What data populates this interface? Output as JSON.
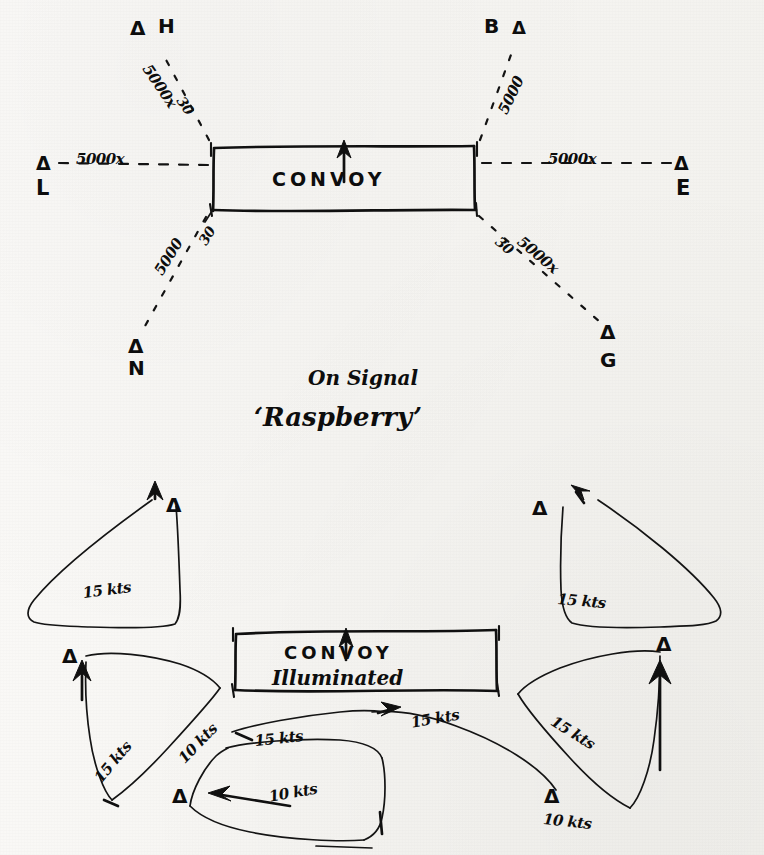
{
  "document": {
    "kind": "hand-drawn naval tactical diagram",
    "ink_color": "#0d0d0d",
    "paper_color": "#f7f6f3"
  },
  "upper_diagram": {
    "convoy_box_label": "CONVOY",
    "convoy_heading_arrow": "up-arrow",
    "escorts": [
      {
        "id": "H",
        "label": "H",
        "marker": "Δ",
        "position": "port-bow",
        "range": "5000x",
        "bearing": "30"
      },
      {
        "id": "B",
        "label": "B",
        "marker": "Δ",
        "position": "starboard-bow",
        "range": "5000",
        "bearing": ""
      },
      {
        "id": "L",
        "label": "L",
        "marker": "Δ",
        "position": "port-beam",
        "range": "5000x",
        "bearing": ""
      },
      {
        "id": "E",
        "label": "E",
        "marker": "Δ",
        "position": "starboard-beam",
        "range": "5000x",
        "bearing": ""
      },
      {
        "id": "N",
        "label": "N",
        "marker": "Δ",
        "position": "port-quarter",
        "range": "5000",
        "bearing": "30"
      },
      {
        "id": "G",
        "label": "G",
        "marker": "Δ",
        "position": "starboard-quarter",
        "range": "5000x",
        "bearing": "30"
      }
    ],
    "range_labels": {
      "port_bow": "5000x",
      "port_bow_bearing": "30",
      "starboard_bow": "5000",
      "port_beam": "5000x",
      "starboard_beam": "5000x",
      "port_quarter": "5000",
      "port_quarter_bearing": "30",
      "starboard_quarter": "5000x",
      "starboard_quarter_bearing": "30"
    }
  },
  "signal_caption": {
    "line1": "On Signal",
    "line2": "‘Raspberry’"
  },
  "lower_diagram": {
    "convoy_box_line1": "CONVOY",
    "convoy_box_line2": "Illuminated",
    "convoy_heading_arrow": "up-arrow",
    "search_tracks": [
      {
        "id": "port-bow-track",
        "marker": "Δ",
        "speed": "15 kts"
      },
      {
        "id": "starboard-bow-track",
        "marker": "Δ",
        "speed": "15 kts"
      },
      {
        "id": "port-beam-track",
        "marker": "Δ",
        "speed": "15 kts"
      },
      {
        "id": "starboard-beam-track",
        "marker": "Δ",
        "speed": "15 kts"
      },
      {
        "id": "astern-track-outbound",
        "marker": "Δ",
        "speed": "15 kts"
      },
      {
        "id": "astern-track-return",
        "marker": "Δ",
        "speed": "10 kts"
      },
      {
        "id": "stern-link-track",
        "marker": "Δ",
        "speed": "10 kts"
      },
      {
        "id": "starboard-quarter-track",
        "marker": "Δ",
        "speed": "10 kts"
      }
    ],
    "speed_labels": {
      "upper_left": "15 kts",
      "upper_right": "15 kts",
      "mid_left": "15 kts",
      "mid_right": "15 kts",
      "centre_right": "15 kts",
      "centre_bottom": "15 kts",
      "ten_left": "10 kts",
      "ten_bottom": "10 kts",
      "ten_right": "10 kts"
    }
  }
}
